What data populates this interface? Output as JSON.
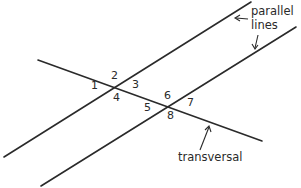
{
  "diagram": {
    "colors": {
      "line": "#2a2a2a",
      "background": "#ffffff"
    },
    "angle_labels": [
      {
        "id": "1",
        "text": "1",
        "x": 93,
        "y": 85
      },
      {
        "id": "2",
        "text": "2",
        "x": 111,
        "y": 70
      },
      {
        "id": "3",
        "text": "3",
        "x": 132,
        "y": 80
      },
      {
        "id": "4",
        "text": "4",
        "x": 113,
        "y": 95
      },
      {
        "id": "5",
        "text": "5",
        "x": 145,
        "y": 104
      },
      {
        "id": "6",
        "text": "6",
        "x": 165,
        "y": 91
      },
      {
        "id": "7",
        "text": "7",
        "x": 187,
        "y": 99
      },
      {
        "id": "8",
        "text": "8",
        "x": 167,
        "y": 112
      }
    ],
    "annotations": {
      "parallel_lines_line1": "parallel",
      "parallel_lines_line2": "lines",
      "transversal": "transversal"
    }
  }
}
